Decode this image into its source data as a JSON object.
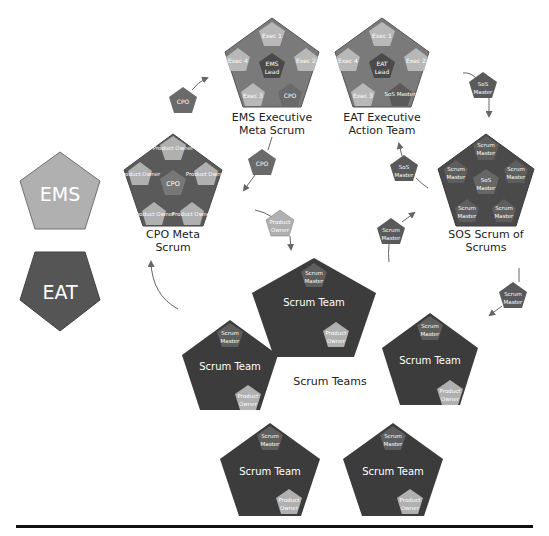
{
  "colors": {
    "ems_light": "#a8a8a8",
    "eat_dark": "#5a5a5a",
    "team_dark": "#3c3c3c",
    "mid": "#707070",
    "light_sub": "#b4b4b4",
    "stroke": "#4a4a4a",
    "arrow": "#666666",
    "rule": "#111111"
  },
  "legend": {
    "ems": "EMS",
    "eat": "EAT"
  },
  "ems_group": {
    "caption_line1": "EMS Executive",
    "caption_line2": "Meta Scrum",
    "center_line1": "EMS",
    "center_line2": "Lead",
    "members": [
      "Exec 1",
      "Exec 2",
      "CPO",
      "Exec 3",
      "Exec 4"
    ]
  },
  "eat_group": {
    "caption_line1": "EAT Executive",
    "caption_line2": "Action Team",
    "center_line1": "EAT",
    "center_line2": "Lead",
    "members": [
      "Exec 1",
      "Exec 2",
      "SoS Master",
      "Exec 3",
      "Exec 4"
    ]
  },
  "cpo_group": {
    "caption_line1": "CPO Meta",
    "caption_line2": "Scrum",
    "center": "CPO",
    "members": [
      "Product Owner",
      "Product Owner",
      "Product Owner",
      "Product Owner",
      "Product Owner"
    ]
  },
  "sos_group": {
    "caption_line1": "SOS Scrum of",
    "caption_line2": "Scrums",
    "center_line1": "SoS",
    "center_line2": "Master",
    "members": [
      "Scrum Master",
      "Scrum Master",
      "Scrum Master",
      "Scrum Master",
      "Scrum Master"
    ]
  },
  "connectors": {
    "cpo_to_ems": "CPO",
    "ems_cpo_down": "CPO",
    "po_to_teams_line1": "Product",
    "po_to_teams_line2": "Owner",
    "sos_to_eat_line1": "SoS",
    "sos_to_eat_line2": "Master",
    "eat_sos_down_line1": "SoS",
    "eat_sos_down_line2": "Master",
    "sm_to_sos_line1": "Scrum",
    "sm_to_sos_line2": "Master",
    "sm_right_line1": "Scrum",
    "sm_right_line2": "Master"
  },
  "scrum_teams": {
    "caption": "Scrum Teams",
    "team_label": "Scrum Team",
    "sm_line1": "Scrum",
    "sm_line2": "Master",
    "po_line1": "Product",
    "po_line2": "Owner",
    "count": 5
  }
}
